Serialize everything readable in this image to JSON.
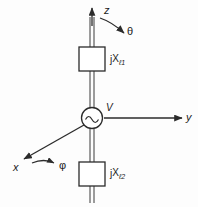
{
  "figure": {
    "background_color": "#fdfdfd",
    "line_color": "#2b2b2b",
    "text_color": "#1b1b1b"
  },
  "axes": {
    "z": {
      "label": "z",
      "direction": "up"
    },
    "y": {
      "label": "y",
      "direction": "right"
    },
    "x": {
      "label": "x",
      "direction": "down-left"
    }
  },
  "angles": {
    "theta": {
      "label": "θ",
      "arrow": "curved-from-z-axis"
    },
    "phi": {
      "label": "φ",
      "arrow": "curved-from-x-axis"
    }
  },
  "source": {
    "label": "V",
    "symbol": "ac-source-sine",
    "icon_name": "ac-source-icon"
  },
  "elements": [
    {
      "name": "upper-reactance",
      "prefix": "j",
      "variable": "X",
      "subscript": "ℓ1"
    },
    {
      "name": "lower-reactance",
      "prefix": "j",
      "variable": "X",
      "subscript": "ℓ2"
    }
  ]
}
